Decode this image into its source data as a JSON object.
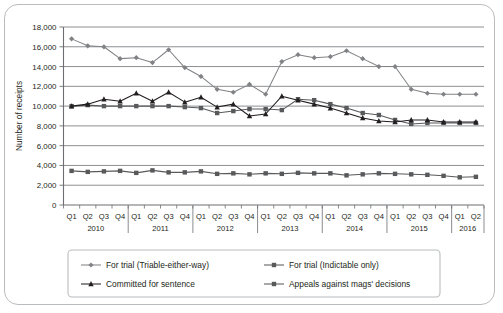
{
  "chart_data": {
    "type": "line",
    "title": "",
    "xlabel": "",
    "ylabel": "Number of receipts",
    "ylim": [
      0,
      18000
    ],
    "ytick_values": [
      0,
      2000,
      4000,
      6000,
      8000,
      10000,
      12000,
      14000,
      16000,
      18000
    ],
    "ytick_labels": [
      "0",
      "2,000",
      "4,000",
      "6,000",
      "8,000",
      "10,000",
      "12,000",
      "14,000",
      "16,000",
      "18,000"
    ],
    "grid": true,
    "legend_position": "bottom",
    "categories": [
      "Q1 2010",
      "Q2 2010",
      "Q3 2010",
      "Q4 2010",
      "Q1 2011",
      "Q2 2011",
      "Q3 2011",
      "Q4 2011",
      "Q1 2012",
      "Q2 2012",
      "Q3 2012",
      "Q4 2012",
      "Q1 2013",
      "Q2 2013",
      "Q3 2013",
      "Q4 2013",
      "Q1 2014",
      "Q2 2014",
      "Q3 2014",
      "Q4 2014",
      "Q1 2015",
      "Q2 2015",
      "Q3 2015",
      "Q4 2015",
      "Q1 2016",
      "Q2 2016"
    ],
    "quarter_labels": [
      "Q1",
      "Q2",
      "Q3",
      "Q4",
      "Q1",
      "Q2",
      "Q3",
      "Q4",
      "Q1",
      "Q2",
      "Q3",
      "Q4",
      "Q1",
      "Q2",
      "Q3",
      "Q4",
      "Q1",
      "Q2",
      "Q3",
      "Q4",
      "Q1",
      "Q2",
      "Q3",
      "Q4",
      "Q1",
      "Q2"
    ],
    "year_groups": [
      {
        "year": "2010",
        "start_index": 0,
        "count": 4
      },
      {
        "year": "2011",
        "start_index": 4,
        "count": 4
      },
      {
        "year": "2012",
        "start_index": 8,
        "count": 4
      },
      {
        "year": "2013",
        "start_index": 12,
        "count": 4
      },
      {
        "year": "2014",
        "start_index": 16,
        "count": 4
      },
      {
        "year": "2015",
        "start_index": 20,
        "count": 4
      },
      {
        "year": "2016",
        "start_index": 24,
        "count": 2
      }
    ],
    "series": [
      {
        "name": "For trial (Triable-either-way)",
        "marker": "diamond",
        "color": "#808285",
        "values": [
          16800,
          16100,
          16000,
          14800,
          14900,
          14400,
          15700,
          13900,
          13000,
          11700,
          11400,
          12200,
          11200,
          14500,
          15200,
          14900,
          15000,
          15600,
          14800,
          14000,
          14000,
          11700,
          11300,
          11200,
          11200,
          11200
        ]
      },
      {
        "name": "For trial (Indictable only)",
        "marker": "square",
        "color": "#58595b",
        "values": [
          10000,
          10100,
          10000,
          10000,
          10000,
          10000,
          10000,
          9900,
          9800,
          9300,
          9500,
          9700,
          9700,
          9600,
          10700,
          10600,
          10200,
          9800,
          9300,
          9100,
          8600,
          8200,
          8300,
          8300,
          8300,
          8300
        ]
      },
      {
        "name": "Committed for sentence",
        "marker": "triangle",
        "color": "#231f20",
        "values": [
          10000,
          10200,
          10700,
          10500,
          11300,
          10500,
          11400,
          10400,
          10900,
          9900,
          10200,
          9000,
          9200,
          11000,
          10600,
          10200,
          9800,
          9300,
          8800,
          8500,
          8400,
          8600,
          8600,
          8400,
          8400,
          8400
        ]
      },
      {
        "name": "Appeals against mags' decisions",
        "marker": "square",
        "color": "#58595b",
        "values": [
          3450,
          3350,
          3400,
          3450,
          3250,
          3500,
          3300,
          3300,
          3400,
          3150,
          3200,
          3100,
          3200,
          3150,
          3250,
          3200,
          3200,
          3000,
          3100,
          3200,
          3150,
          3100,
          3050,
          2950,
          2800,
          2850
        ]
      }
    ],
    "secondary_series_note": "",
    "legend_entries": [
      {
        "label": "For trial (Triable-either-way)",
        "marker": "diamond"
      },
      {
        "label": "For trial (Indictable only)",
        "marker": "square"
      },
      {
        "label": "Committed for sentence",
        "marker": "triangle"
      },
      {
        "label": "Appeals against mags' decisions",
        "marker": "square"
      }
    ]
  },
  "colors": {
    "frame_border": "#b9bcbe",
    "grid": "#808285",
    "axis": "#6d6e71",
    "text": "#231f20",
    "background": "#ffffff"
  }
}
